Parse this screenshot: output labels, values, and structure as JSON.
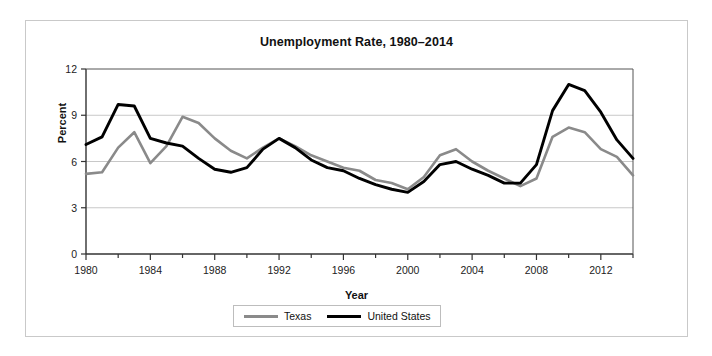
{
  "figure": {
    "title": "Unemployment Rate, 1980–2014",
    "xlabel": "Year",
    "ylabel": "Percent"
  },
  "legend": {
    "position": "bottom-center",
    "entries": [
      {
        "name": "Texas",
        "color": "#8a8a8a"
      },
      {
        "name": "United States",
        "color": "#000000"
      }
    ]
  },
  "axis": {
    "y_ticks": [
      "0",
      "3",
      "6",
      "9",
      "12"
    ],
    "x_ticks": [
      "1980",
      "1984",
      "1988",
      "1992",
      "1996",
      "2000",
      "2004",
      "2008",
      "2012"
    ]
  },
  "chart_data": {
    "type": "line",
    "title": "Unemployment Rate, 1980–2014",
    "xlabel": "Year",
    "ylabel": "Percent",
    "xlim": [
      1980,
      2014
    ],
    "ylim": [
      0,
      12
    ],
    "grid": "horizontal",
    "legend_position": "bottom-center",
    "x": [
      1980,
      1981,
      1982,
      1983,
      1984,
      1985,
      1986,
      1987,
      1988,
      1989,
      1990,
      1991,
      1992,
      1993,
      1994,
      1995,
      1996,
      1997,
      1998,
      1999,
      2000,
      2001,
      2002,
      2003,
      2004,
      2005,
      2006,
      2007,
      2008,
      2009,
      2010,
      2011,
      2012,
      2013,
      2014
    ],
    "series": [
      {
        "name": "Texas",
        "color": "#8a8a8a",
        "values": [
          5.2,
          5.3,
          6.9,
          7.9,
          5.9,
          7.0,
          8.9,
          8.5,
          7.5,
          6.7,
          6.2,
          6.9,
          7.5,
          7.0,
          6.4,
          6.0,
          5.6,
          5.4,
          4.8,
          4.6,
          4.2,
          5.0,
          6.4,
          6.8,
          6.0,
          5.4,
          4.9,
          4.4,
          4.9,
          7.6,
          8.2,
          7.9,
          6.8,
          6.3,
          5.1
        ]
      },
      {
        "name": "United States",
        "color": "#000000",
        "values": [
          7.1,
          7.6,
          9.7,
          9.6,
          7.5,
          7.2,
          7.0,
          6.2,
          5.5,
          5.3,
          5.6,
          6.8,
          7.5,
          6.9,
          6.1,
          5.6,
          5.4,
          4.9,
          4.5,
          4.2,
          4.0,
          4.7,
          5.8,
          6.0,
          5.5,
          5.1,
          4.6,
          4.6,
          5.8,
          9.3,
          11.0,
          10.6,
          9.2,
          7.4,
          6.2
        ]
      }
    ]
  }
}
